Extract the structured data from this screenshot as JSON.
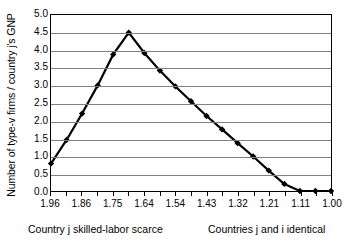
{
  "chart_data": {
    "type": "line",
    "title": "",
    "xlabel": "",
    "ylabel": "Number of type-v firms / country j's GNP",
    "ylim": [
      0.0,
      5.0
    ],
    "ytick_labels": [
      "5.0",
      "4.5",
      "4.0",
      "3.5",
      "3.0",
      "2.5",
      "2.0",
      "1.5",
      "1.0",
      "0.5",
      "0.0"
    ],
    "ytick_values": [
      5.0,
      4.5,
      4.0,
      3.5,
      3.0,
      2.5,
      2.0,
      1.5,
      1.0,
      0.5,
      0.0
    ],
    "grid": "horizontal",
    "legend": "none",
    "marker": "diamond",
    "line_color": "#000000",
    "grid_color": "#808080",
    "border_color": "#000000",
    "n_ticks": 19,
    "xtick_labels": [
      "1.96",
      "",
      "1.86",
      "",
      "1.75",
      "",
      "1.64",
      "",
      "1.54",
      "",
      "1.43",
      "",
      "1.32",
      "",
      "1.21",
      "",
      "1.11",
      "",
      "1.00"
    ],
    "categories": [
      "1.96",
      "1.91",
      "1.86",
      "1.80",
      "1.75",
      "1.70",
      "1.64",
      "1.59",
      "1.54",
      "1.49",
      "1.43",
      "1.38",
      "1.32",
      "1.27",
      "1.21",
      "1.16",
      "1.11",
      "1.05",
      "1.00"
    ],
    "values": [
      0.78,
      1.45,
      2.2,
      3.0,
      3.88,
      4.5,
      3.92,
      3.42,
      2.97,
      2.55,
      2.13,
      1.75,
      1.36,
      0.98,
      0.58,
      0.2,
      0.0,
      0.0,
      0.0
    ],
    "annotations": {
      "left_caption": "Country j skilled-labor scarce",
      "right_caption": "Countries j and i identical"
    }
  },
  "captions": {
    "left": "Country j skilled-labor scarce",
    "right": "Countries j and i identical"
  }
}
